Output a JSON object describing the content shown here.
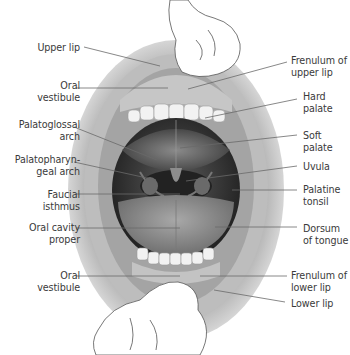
{
  "diagram": {
    "type": "anatomical-illustration",
    "left_labels": [
      {
        "id": "upper-lip",
        "text": "Upper lip",
        "x": 8,
        "y": 42,
        "w": 72,
        "line": [
          84,
          47,
          160,
          66
        ]
      },
      {
        "id": "oral-vestibule-upper",
        "text": "Oral\nvestibule",
        "x": 8,
        "y": 80,
        "w": 72,
        "line": [
          76,
          88,
          168,
          88
        ]
      },
      {
        "id": "palatoglossal-arch",
        "text": "Palatoglossal\narch",
        "x": 8,
        "y": 119,
        "w": 72,
        "line": [
          74,
          127,
          157,
          160
        ]
      },
      {
        "id": "palatopharyngeal-arch",
        "text": "Palatopharyn-\ngeal arch",
        "x": 8,
        "y": 154,
        "w": 72,
        "line": [
          74,
          162,
          156,
          180
        ]
      },
      {
        "id": "faucial-isthmus",
        "text": "Faucial\nisthmus",
        "x": 8,
        "y": 189,
        "w": 72,
        "line": [
          76,
          194,
          180,
          194
        ]
      },
      {
        "id": "oral-cavity-proper",
        "text": "Oral cavity\nproper",
        "x": 8,
        "y": 222,
        "w": 72,
        "line": [
          76,
          228,
          180,
          228
        ]
      },
      {
        "id": "oral-vestibule-lower",
        "text": "Oral\nvestibule",
        "x": 8,
        "y": 270,
        "w": 72,
        "line": [
          76,
          276,
          180,
          276
        ]
      }
    ],
    "right_labels": [
      {
        "id": "frenulum-upper-lip",
        "text": "Frenulum of\nupper lip",
        "x": 291,
        "y": 55,
        "w": 60,
        "line": [
          287,
          62,
          188,
          89
        ]
      },
      {
        "id": "hard-palate",
        "text": "Hard\npalate",
        "x": 303,
        "y": 91,
        "w": 46,
        "line": [
          297,
          99,
          205,
          118
        ]
      },
      {
        "id": "soft-palate",
        "text": "Soft\npalate",
        "x": 303,
        "y": 130,
        "w": 46,
        "line": [
          297,
          135,
          180,
          148
        ]
      },
      {
        "id": "uvula",
        "text": "Uvula",
        "x": 303,
        "y": 161,
        "w": 46,
        "line": [
          297,
          166,
          186,
          181
        ]
      },
      {
        "id": "palatine-tonsil",
        "text": "Palatine\ntonsil",
        "x": 303,
        "y": 184,
        "w": 46,
        "line": [
          297,
          190,
          232,
          190
        ]
      },
      {
        "id": "dorsum-of-tongue",
        "text": "Dorsum\nof tongue",
        "x": 303,
        "y": 223,
        "w": 46,
        "line": [
          297,
          227,
          215,
          227
        ]
      },
      {
        "id": "frenulum-lower-lip",
        "text": "Frenulum of\nlower lip",
        "x": 291,
        "y": 270,
        "w": 60,
        "line": [
          287,
          276,
          200,
          276
        ]
      },
      {
        "id": "lower-lip",
        "text": "Lower lip",
        "x": 291,
        "y": 298,
        "w": 60,
        "line": [
          285,
          302,
          214,
          290
        ]
      }
    ],
    "colors": {
      "label_text": "#3a3a3a",
      "leader_line": "#6a6a6a",
      "skin": "#cfcfcf",
      "skin_dark": "#8f8f8f",
      "cavity": "#2a2a2a",
      "tongue": "#9a9a9a",
      "teeth": "#f4f4f4",
      "finger": "#ffffff"
    }
  }
}
